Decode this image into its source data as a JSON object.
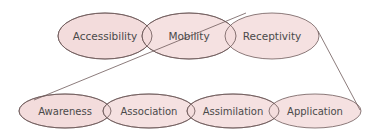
{
  "colors": {
    "fill": "#f3dcdc",
    "stroke": "#6e5a5a",
    "text": "#4a4a4a",
    "background": "#ffffff"
  },
  "top_row": {
    "items": [
      {
        "label": "Accessibility"
      },
      {
        "label": "Mobility"
      },
      {
        "label": "Receptivity"
      }
    ]
  },
  "bottom_row": {
    "items": [
      {
        "label": "Awareness"
      },
      {
        "label": "Association"
      },
      {
        "label": "Assimilation"
      },
      {
        "label": "Application"
      }
    ]
  },
  "connectors": [
    {
      "from": "Receptivity (top-left)",
      "to": "Awareness (left tip)"
    },
    {
      "from": "Receptivity (right edge)",
      "to": "Application (right tip)"
    }
  ]
}
